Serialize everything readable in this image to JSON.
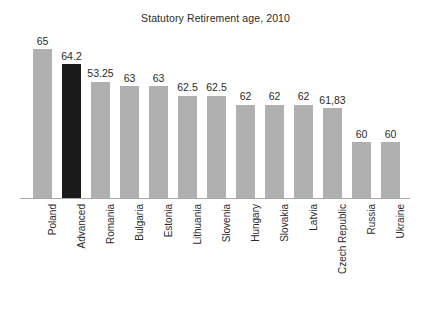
{
  "chart_data": {
    "type": "bar",
    "title": "Statutory Retirement age, 2010",
    "xlabel": "",
    "ylabel": "",
    "grid": false,
    "legend": "none",
    "ylim": [
      57,
      65.6
    ],
    "axis": {
      "baseline_value": 57
    },
    "categories": [
      "Poland",
      "Advanced",
      "Romania",
      "Bulgaria",
      "Estonia",
      "Lithuania",
      "Slovenia",
      "Hungary",
      "Slovakia",
      "Latvia",
      "Czech Republic",
      "Russia",
      "Ukraine"
    ],
    "values": [
      65,
      64.2,
      63.25,
      63,
      63,
      62.5,
      62.5,
      62,
      62,
      62,
      61.83,
      60,
      60
    ],
    "value_labels": [
      "65",
      "64.2",
      "53.25",
      "63",
      "63",
      "62.5",
      "62.5",
      "62",
      "62",
      "62",
      "61,83",
      "60",
      "60"
    ],
    "highlight_index": 1,
    "colors": {
      "bar": "#b0b0b0",
      "bar_highlight": "#1a1a1a",
      "text": "#2b2b2b",
      "axis": "#a8a8a8",
      "background": "#ffffff"
    }
  }
}
